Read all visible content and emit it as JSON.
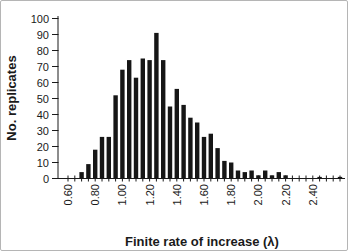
{
  "figure": {
    "background": "#ffffff",
    "border_color": "#b5b5b5",
    "bar_color": "#161616",
    "axis_color": "#1a1a1a"
  },
  "chart_data": {
    "type": "bar",
    "title": "",
    "xlabel": "Finite rate of increase (λ)",
    "ylabel": "No. replicates",
    "ylim": [
      0,
      100
    ],
    "grid": false,
    "legend": "none",
    "bin_width": 0.05,
    "y_ticks": [
      0,
      10,
      20,
      30,
      40,
      50,
      60,
      70,
      80,
      90,
      100
    ],
    "x_tick_labels": [
      "0.60",
      "0.80",
      "1.00",
      "1.20",
      "1.40",
      "1.60",
      "1.80",
      "2.00",
      "2.20",
      "2.40"
    ],
    "categories": [
      "0.60",
      "0.65",
      "0.70",
      "0.75",
      "0.80",
      "0.85",
      "0.90",
      "0.95",
      "1.00",
      "1.05",
      "1.10",
      "1.15",
      "1.20",
      "1.25",
      "1.30",
      "1.35",
      "1.40",
      "1.45",
      "1.50",
      "1.55",
      "1.60",
      "1.65",
      "1.70",
      "1.75",
      "1.80",
      "1.85",
      "1.90",
      "1.95",
      "2.00",
      "2.05",
      "2.10",
      "2.15",
      "2.20",
      "2.25",
      "2.30",
      "2.35",
      "2.40",
      "2.45",
      "2.50",
      "2.55",
      "2.60"
    ],
    "values": [
      0,
      0,
      4,
      9,
      18,
      26,
      26,
      52,
      68,
      74,
      63,
      75,
      74,
      91,
      74,
      45,
      56,
      46,
      38,
      35,
      26,
      28,
      19,
      11,
      10,
      5,
      4,
      5,
      2,
      5,
      2,
      4,
      2,
      0,
      0,
      0,
      0,
      1,
      0,
      0,
      1
    ]
  }
}
